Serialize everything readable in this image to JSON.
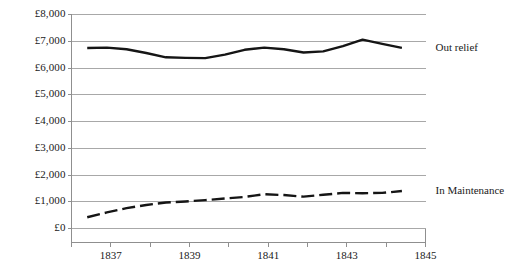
{
  "chart_data": {
    "type": "line",
    "title": "",
    "subtitle": "",
    "xlabel": "",
    "ylabel": "",
    "xlim": [
      1836,
      1845
    ],
    "ylim": [
      0,
      8000
    ],
    "grid": true,
    "grid_axis": "y",
    "legend_position": "right-inline",
    "currency_symbol": "£",
    "ytick_labels": [
      "£8,000",
      "£7,000",
      "£6,000",
      "£5,000",
      "£4,000",
      "£3,000",
      "£2,000",
      "£1,000",
      "£0"
    ],
    "ytick_values": [
      8000,
      7000,
      6000,
      5000,
      4000,
      3000,
      2000,
      1000,
      0
    ],
    "xtick_labels": [
      "1837",
      "1839",
      "1841",
      "1843",
      "1845"
    ],
    "xtick_values": [
      1837,
      1839,
      1841,
      1843,
      1845
    ],
    "xtick_minor_values": [
      1836,
      1838,
      1840,
      1842,
      1844
    ],
    "x": [
      1836.4,
      1836.9,
      1837.4,
      1837.9,
      1838.4,
      1838.9,
      1839.4,
      1839.9,
      1840.4,
      1840.9,
      1841.4,
      1841.9,
      1842.4,
      1842.9,
      1843.4,
      1843.9,
      1844.4
    ],
    "series": [
      {
        "name": "Out relief",
        "label": "Out relief",
        "color": "#151515",
        "style": "solid",
        "values": [
          6750,
          6760,
          6700,
          6560,
          6400,
          6380,
          6370,
          6500,
          6680,
          6760,
          6700,
          6580,
          6620,
          6820,
          7060,
          6900,
          6750
        ]
      },
      {
        "name": "In Maintenance",
        "label": "In Maintenance",
        "color": "#151515",
        "style": "dashed",
        "values": [
          420,
          600,
          760,
          880,
          970,
          1010,
          1060,
          1120,
          1180,
          1280,
          1250,
          1190,
          1260,
          1330,
          1320,
          1330,
          1400
        ]
      }
    ]
  }
}
